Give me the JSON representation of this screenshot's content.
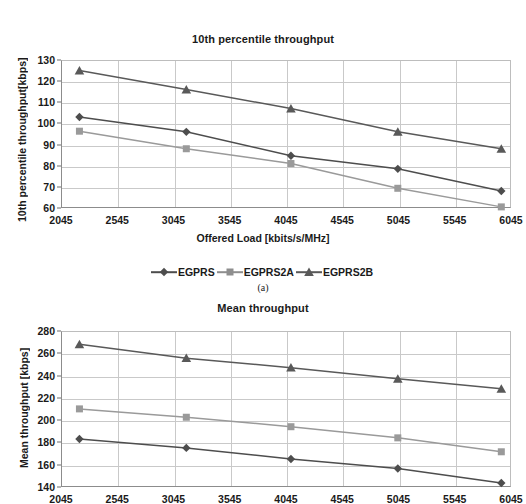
{
  "figure": {
    "subcaption_a": "(a)"
  },
  "legend": {
    "position": "bottom-center",
    "items": [
      {
        "label": "EGPRS",
        "marker": "diamond",
        "color": "#4d4d4d"
      },
      {
        "label": "EGPRS2A",
        "marker": "square",
        "color": "#8e8e8e"
      },
      {
        "label": "EGPRS2B",
        "marker": "triangle",
        "color": "#595959"
      }
    ]
  },
  "chart_data": [
    {
      "id": "chart-10th-percentile",
      "type": "line",
      "title": "10th percentile throughput",
      "xlabel": "Offered Load [kbits/s/MHz]",
      "ylabel": "10th percentile throughput[kbps]",
      "grid": true,
      "xlim": [
        2045,
        6045
      ],
      "ylim": [
        60,
        130
      ],
      "xticks": [
        2045,
        2545,
        3045,
        3545,
        4045,
        4545,
        5045,
        5545,
        6045
      ],
      "yticks": [
        60,
        70,
        80,
        90,
        100,
        110,
        120,
        130
      ],
      "x": [
        2200,
        3150,
        4080,
        5030,
        5950
      ],
      "series": [
        {
          "name": "EGPRS",
          "marker": "diamond",
          "color": "#4d4d4d",
          "values": [
            103.5,
            96.5,
            85.2,
            79.0,
            68.5
          ]
        },
        {
          "name": "EGPRS2A",
          "marker": "square",
          "color": "#9a9a9a",
          "values": [
            96.8,
            88.5,
            81.5,
            69.8,
            61.0
          ]
        },
        {
          "name": "EGPRS2B",
          "marker": "triangle",
          "color": "#595959",
          "values": [
            125.5,
            116.5,
            107.5,
            96.5,
            88.5
          ]
        }
      ]
    },
    {
      "id": "chart-mean-throughput",
      "type": "line",
      "title": "Mean throughput",
      "xlabel": "",
      "ylabel": "Mean throughput [kbps]",
      "grid": true,
      "xlim": [
        2045,
        6045
      ],
      "ylim": [
        140,
        280
      ],
      "xticks": [
        2045,
        2545,
        3045,
        3545,
        4045,
        4545,
        5045,
        5545,
        6045
      ],
      "yticks": [
        140,
        160,
        180,
        200,
        220,
        240,
        260,
        280
      ],
      "x": [
        2200,
        3150,
        4080,
        5030,
        5950
      ],
      "series": [
        {
          "name": "EGPRS",
          "marker": "diamond",
          "color": "#4d4d4d",
          "values": [
            184,
            176,
            166,
            157.5,
            144.5
          ]
        },
        {
          "name": "EGPRS2A",
          "marker": "square",
          "color": "#9a9a9a",
          "values": [
            211,
            203.5,
            195,
            185,
            172.5
          ]
        },
        {
          "name": "EGPRS2B",
          "marker": "triangle",
          "color": "#595959",
          "values": [
            269,
            256.5,
            248,
            238,
            229
          ]
        }
      ]
    }
  ]
}
